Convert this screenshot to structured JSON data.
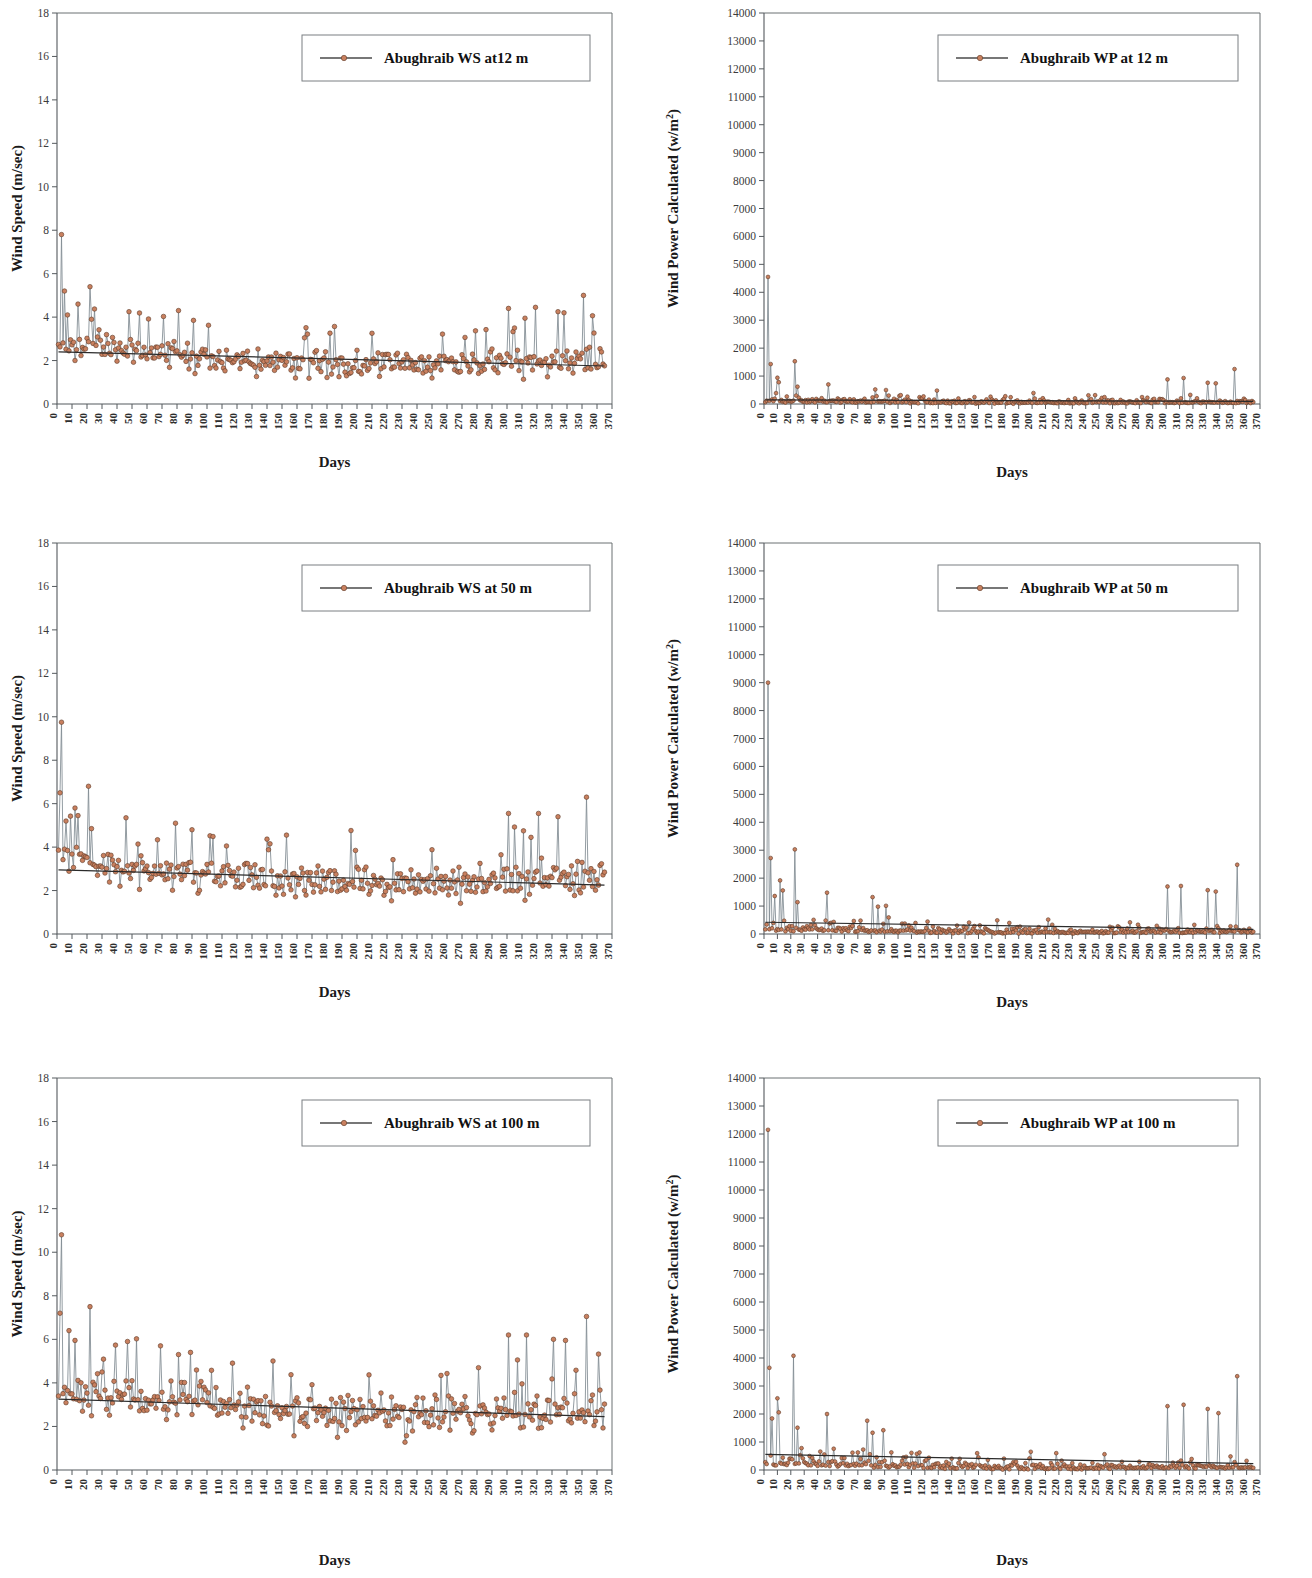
{
  "figure": {
    "panel_count": 6,
    "layout": "3 rows x 2 columns",
    "marker_color": "#c9805f",
    "marker_edge_color": "#5e3a28",
    "series_line_color": "#7f8a91",
    "trend_line_color": "#2b2b2b"
  },
  "axis_titles": {
    "x": "Days",
    "y_speed": "Wind Speed (m/sec)",
    "y_power_base": "Wind Power Calculated (w/m",
    "y_power_sup": "2",
    "y_power_close": ")"
  },
  "chart_data": [
    {
      "id": "ws-12m",
      "type": "line",
      "title": "",
      "legend": [
        "Abughraib WS at12 m"
      ],
      "legend_position": "top-right",
      "xlabel": "Days",
      "ylabel": "Wind Speed (m/sec)",
      "xlim": [
        0,
        370
      ],
      "ylim": [
        0,
        18
      ],
      "yticks": [
        0,
        2,
        4,
        6,
        8,
        10,
        12,
        14,
        16,
        18
      ],
      "xticks": [
        0,
        10,
        20,
        30,
        40,
        50,
        60,
        70,
        80,
        90,
        100,
        110,
        120,
        130,
        140,
        150,
        160,
        170,
        180,
        190,
        200,
        210,
        220,
        230,
        240,
        250,
        260,
        270,
        280,
        290,
        300,
        310,
        320,
        330,
        340,
        350,
        360,
        370
      ],
      "grid": false,
      "trend": {
        "start": 2.4,
        "end": 1.75
      },
      "baseline": 2.0,
      "noise": 0.62,
      "seed": 11,
      "spikes": [
        [
          2,
          7.8
        ],
        [
          4,
          5.2
        ],
        [
          6,
          4.1
        ],
        [
          13,
          4.6
        ],
        [
          21,
          5.4
        ],
        [
          22,
          3.9
        ],
        [
          47,
          4.25
        ],
        [
          80,
          4.3
        ],
        [
          90,
          3.85
        ],
        [
          300,
          4.4
        ],
        [
          304,
          3.5
        ],
        [
          311,
          3.95
        ],
        [
          318,
          4.45
        ],
        [
          333,
          4.25
        ],
        [
          337,
          4.2
        ],
        [
          350,
          5.0
        ]
      ],
      "n_points": 365
    },
    {
      "id": "wp-12m",
      "type": "line",
      "title": "",
      "legend": [
        "Abughraib WP at 12 m"
      ],
      "legend_position": "top-right",
      "xlabel": "Days",
      "ylabel": "Wind Power Calculated (w/m2)",
      "xlim": [
        0,
        370
      ],
      "ylim": [
        0,
        14000
      ],
      "yticks": [
        0,
        1000,
        2000,
        3000,
        4000,
        5000,
        6000,
        7000,
        8000,
        9000,
        10000,
        11000,
        12000,
        13000,
        14000
      ],
      "xticks": [
        0,
        10,
        20,
        30,
        40,
        50,
        60,
        70,
        80,
        90,
        100,
        110,
        120,
        130,
        140,
        150,
        160,
        170,
        180,
        190,
        200,
        210,
        220,
        230,
        240,
        250,
        260,
        270,
        280,
        290,
        300,
        310,
        320,
        330,
        340,
        350,
        360,
        370
      ],
      "grid": false,
      "trend": {
        "start": 150,
        "end": 95
      },
      "baseline": 110,
      "noise": 95,
      "seed": 23,
      "spikes": [
        [
          2,
          4550
        ],
        [
          4,
          1430
        ],
        [
          9,
          940
        ],
        [
          10,
          780
        ],
        [
          22,
          1530
        ],
        [
          24,
          620
        ],
        [
          47,
          700
        ],
        [
          82,
          520
        ],
        [
          90,
          500
        ],
        [
          128,
          480
        ],
        [
          300,
          880
        ],
        [
          312,
          930
        ],
        [
          330,
          760
        ],
        [
          336,
          740
        ],
        [
          350,
          1250
        ]
      ],
      "n_points": 365
    },
    {
      "id": "ws-50m",
      "type": "line",
      "title": "",
      "legend": [
        "Abughraib WS at 50 m"
      ],
      "legend_position": "top-right",
      "xlabel": "Days",
      "ylabel": "Wind Speed (m/sec)",
      "xlim": [
        0,
        370
      ],
      "ylim": [
        0,
        18
      ],
      "yticks": [
        0,
        2,
        4,
        6,
        8,
        10,
        12,
        14,
        16,
        18
      ],
      "xticks": [
        0,
        10,
        20,
        30,
        40,
        50,
        60,
        70,
        80,
        90,
        100,
        110,
        120,
        130,
        140,
        150,
        160,
        170,
        180,
        190,
        200,
        210,
        220,
        230,
        240,
        250,
        260,
        270,
        280,
        290,
        300,
        310,
        320,
        330,
        340,
        350,
        360,
        370
      ],
      "grid": false,
      "trend": {
        "start": 2.95,
        "end": 2.25
      },
      "baseline": 2.55,
      "noise": 0.8,
      "seed": 31,
      "spikes": [
        [
          2,
          9.75
        ],
        [
          1,
          6.5
        ],
        [
          5,
          5.2
        ],
        [
          11,
          5.8
        ],
        [
          13,
          5.45
        ],
        [
          20,
          6.8
        ],
        [
          22,
          4.85
        ],
        [
          45,
          5.35
        ],
        [
          78,
          5.1
        ],
        [
          89,
          4.8
        ],
        [
          300,
          5.55
        ],
        [
          310,
          4.75
        ],
        [
          320,
          5.55
        ],
        [
          333,
          5.4
        ],
        [
          352,
          6.3
        ]
      ],
      "n_points": 365
    },
    {
      "id": "wp-50m",
      "type": "line",
      "title": "",
      "legend": [
        "Abughraib WP at 50 m"
      ],
      "legend_position": "top-right",
      "xlabel": "Days",
      "ylabel": "Wind Power Calculated (w/m2)",
      "xlim": [
        0,
        370
      ],
      "ylim": [
        0,
        14000
      ],
      "yticks": [
        0,
        1000,
        2000,
        3000,
        4000,
        5000,
        6000,
        7000,
        8000,
        9000,
        10000,
        11000,
        12000,
        13000,
        14000
      ],
      "xticks": [
        0,
        10,
        20,
        30,
        40,
        50,
        60,
        70,
        80,
        90,
        100,
        110,
        120,
        130,
        140,
        150,
        160,
        170,
        180,
        190,
        200,
        210,
        220,
        230,
        240,
        250,
        260,
        270,
        280,
        290,
        300,
        310,
        320,
        330,
        340,
        350,
        360,
        370
      ],
      "grid": false,
      "trend": {
        "start": 420,
        "end": 165
      },
      "baseline": 210,
      "noise": 150,
      "seed": 47,
      "spikes": [
        [
          2,
          9000
        ],
        [
          4,
          2720
        ],
        [
          7,
          1360
        ],
        [
          11,
          1920
        ],
        [
          13,
          1560
        ],
        [
          22,
          3030
        ],
        [
          24,
          1140
        ],
        [
          46,
          1480
        ],
        [
          80,
          1320
        ],
        [
          84,
          980
        ],
        [
          90,
          1010
        ],
        [
          300,
          1700
        ],
        [
          310,
          1720
        ],
        [
          330,
          1570
        ],
        [
          336,
          1520
        ],
        [
          352,
          2480
        ]
      ],
      "n_points": 365
    },
    {
      "id": "ws-100m",
      "type": "line",
      "title": "",
      "legend": [
        "Abughraib WS at 100 m"
      ],
      "legend_position": "top-right",
      "xlabel": "Days",
      "ylabel": "Wind Speed (m/sec)",
      "xlim": [
        0,
        370
      ],
      "ylim": [
        0,
        18
      ],
      "yticks": [
        0,
        2,
        4,
        6,
        8,
        10,
        12,
        14,
        16,
        18
      ],
      "xticks": [
        0,
        10,
        20,
        30,
        40,
        50,
        60,
        70,
        80,
        90,
        100,
        110,
        120,
        130,
        140,
        150,
        160,
        170,
        180,
        190,
        200,
        210,
        220,
        230,
        240,
        250,
        260,
        270,
        280,
        290,
        300,
        310,
        320,
        330,
        340,
        350,
        360,
        370
      ],
      "grid": false,
      "trend": {
        "start": 3.25,
        "end": 2.45
      },
      "baseline": 2.8,
      "noise": 0.85,
      "seed": 59,
      "spikes": [
        [
          2,
          10.8
        ],
        [
          1,
          7.2
        ],
        [
          7,
          6.4
        ],
        [
          11,
          5.95
        ],
        [
          21,
          7.5
        ],
        [
          29,
          4.5
        ],
        [
          46,
          5.9
        ],
        [
          68,
          5.7
        ],
        [
          80,
          5.3
        ],
        [
          88,
          5.4
        ],
        [
          300,
          6.2
        ],
        [
          312,
          6.2
        ],
        [
          330,
          6.0
        ],
        [
          338,
          5.95
        ],
        [
          352,
          7.05
        ]
      ],
      "n_points": 365
    },
    {
      "id": "wp-100m",
      "type": "line",
      "title": "",
      "legend": [
        "Abughraib WP at 100 m"
      ],
      "legend_position": "top-right",
      "xlabel": "Days",
      "ylabel": "Wind Power Calculated (w/m2)",
      "xlim": [
        0,
        370
      ],
      "ylim": [
        0,
        14000
      ],
      "yticks": [
        0,
        1000,
        2000,
        3000,
        4000,
        5000,
        6000,
        7000,
        8000,
        9000,
        10000,
        11000,
        12000,
        13000,
        14000
      ],
      "xticks": [
        0,
        10,
        20,
        30,
        40,
        50,
        60,
        70,
        80,
        90,
        100,
        110,
        120,
        130,
        140,
        150,
        160,
        170,
        180,
        190,
        200,
        210,
        220,
        230,
        240,
        250,
        260,
        270,
        280,
        290,
        300,
        310,
        320,
        330,
        340,
        350,
        360,
        370
      ],
      "grid": false,
      "trend": {
        "start": 560,
        "end": 230
      },
      "baseline": 280,
      "noise": 190,
      "seed": 71,
      "spikes": [
        [
          2,
          12150
        ],
        [
          3,
          3650
        ],
        [
          5,
          1840
        ],
        [
          9,
          2560
        ],
        [
          10,
          2060
        ],
        [
          21,
          4080
        ],
        [
          24,
          1510
        ],
        [
          46,
          2000
        ],
        [
          76,
          1760
        ],
        [
          80,
          1330
        ],
        [
          88,
          1420
        ],
        [
          300,
          2280
        ],
        [
          312,
          2330
        ],
        [
          330,
          2180
        ],
        [
          338,
          2030
        ],
        [
          352,
          3350
        ]
      ],
      "n_points": 365
    }
  ]
}
